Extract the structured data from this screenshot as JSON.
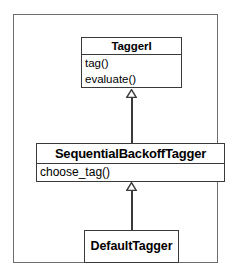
{
  "diagram": {
    "type": "uml-class-diagram",
    "frame": {
      "border_color": "#6e6e6e",
      "background": "#ffffff"
    },
    "classes": [
      {
        "id": "taggeri",
        "name": "TaggerI",
        "stereotype": "interface",
        "members": [
          "tag()",
          "evaluate()"
        ]
      },
      {
        "id": "sequentialbackofftagger",
        "name": "SequentialBackoffTagger",
        "members": [
          "choose_tag()"
        ]
      },
      {
        "id": "defaulttagger",
        "name": "DefaultTagger",
        "members": []
      }
    ],
    "relationships": [
      {
        "id": "gen-1",
        "kind": "generalization",
        "label": "inheritance-arrow-hollow-triangle",
        "from": "SequentialBackoffTagger",
        "to": "TaggerI"
      },
      {
        "id": "gen-2",
        "kind": "generalization",
        "label": "inheritance-arrow-hollow-triangle",
        "from": "DefaultTagger",
        "to": "SequentialBackoffTagger"
      }
    ],
    "colors": {
      "box_border": "#3a3a3a",
      "box_fill": "#ffffff",
      "connector": "#3a3a3a",
      "text": "#000000"
    }
  }
}
